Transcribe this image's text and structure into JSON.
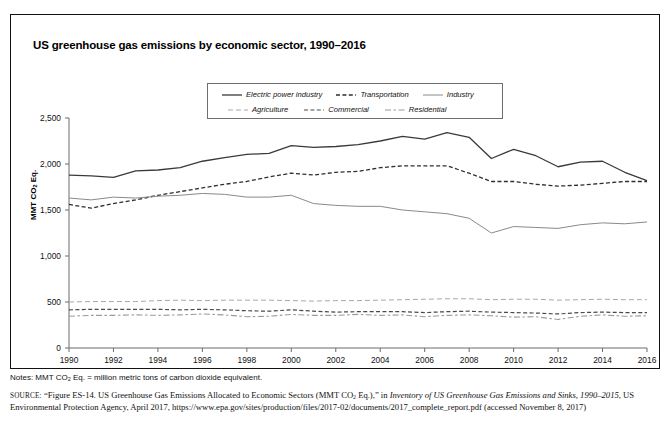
{
  "figure": {
    "title": "US greenhouse gas emissions by economic sector, 1990–2016",
    "notes_prefix": "Notes: MMT CO",
    "notes_sub": "2",
    "notes_suffix": " Eq. = million metric tons of carbon dioxide equivalent.",
    "source_label": "source:",
    "source_part1": "“Figure ES-14. US Greenhouse Gas Emissions Allocated to Economic Sectors (MMT CO",
    "source_sub": "2",
    "source_part2": " Eq.),” in ",
    "source_italic1": "Inventory of US Greenhouse Gas Emissions and Sinks, 1990–2015",
    "source_part3": ", US Environmental Protection Agency, April 2017, https://www.epa.gov/sites/production/files/2017-02/documents/2017_complete_report.pdf (accessed November 8, 2017)"
  },
  "legend": {
    "items": [
      {
        "label": "Electric power industry",
        "style": "solid",
        "color": "#3a3a3a",
        "width": 1.3
      },
      {
        "label": "Transportation",
        "style": "dashed",
        "color": "#2e2e2e",
        "width": 1.3
      },
      {
        "label": "Industry",
        "style": "solid",
        "color": "#8a8a8a",
        "width": 1.0
      },
      {
        "label": "Agriculture",
        "style": "longdash",
        "color": "#a8a8a8",
        "width": 1.0
      },
      {
        "label": "Commercial",
        "style": "dashed",
        "color": "#4a4a4a",
        "width": 1.2
      },
      {
        "label": "Residential",
        "style": "dashdot",
        "color": "#9a9a9a",
        "width": 1.1
      }
    ],
    "row_split": 3
  },
  "chart_data": {
    "type": "line",
    "title": "US greenhouse gas emissions by economic sector, 1990–2016",
    "xlabel": "",
    "ylabel": "MMT CO2 Eq.",
    "ylim": [
      0,
      2500
    ],
    "xlim": [
      1990,
      2016
    ],
    "yticks": [
      0,
      500,
      1000,
      1500,
      2000,
      2500
    ],
    "ytick_labels": [
      "0",
      "500",
      "1,000",
      "1,500",
      "2,000",
      "2,500"
    ],
    "xticks": [
      1990,
      1992,
      1994,
      1996,
      1998,
      2000,
      2002,
      2004,
      2006,
      2008,
      2010,
      2012,
      2014,
      2016
    ],
    "xtick_labels": [
      "1990",
      "1992",
      "1994",
      "1996",
      "1998",
      "2000",
      "2002",
      "2004",
      "2006",
      "2008",
      "2010",
      "2012",
      "2014",
      "2016"
    ],
    "grid": false,
    "legend_position": "top-center",
    "x": [
      1990,
      1991,
      1992,
      1993,
      1994,
      1995,
      1996,
      1997,
      1998,
      1999,
      2000,
      2001,
      2002,
      2003,
      2004,
      2005,
      2006,
      2007,
      2008,
      2009,
      2010,
      2011,
      2012,
      2013,
      2014,
      2015,
      2016
    ],
    "series": [
      {
        "name": "Electric power industry",
        "style": "solid",
        "color": "#3a3a3a",
        "width": 1.3,
        "values": [
          1880,
          1870,
          1855,
          1925,
          1935,
          1960,
          2030,
          2070,
          2105,
          2115,
          2200,
          2180,
          2190,
          2210,
          2250,
          2300,
          2270,
          2340,
          2290,
          2060,
          2160,
          2090,
          1970,
          2020,
          2030,
          1910,
          1820
        ]
      },
      {
        "name": "Transportation",
        "style": "dashed",
        "color": "#2e2e2e",
        "width": 1.3,
        "values": [
          1560,
          1520,
          1570,
          1610,
          1660,
          1700,
          1740,
          1780,
          1810,
          1860,
          1900,
          1880,
          1910,
          1920,
          1960,
          1980,
          1980,
          1980,
          1900,
          1810,
          1810,
          1780,
          1760,
          1770,
          1790,
          1810,
          1810
        ]
      },
      {
        "name": "Industry",
        "style": "solid",
        "color": "#8a8a8a",
        "width": 1.0,
        "values": [
          1630,
          1610,
          1640,
          1630,
          1650,
          1660,
          1680,
          1670,
          1640,
          1640,
          1660,
          1570,
          1550,
          1540,
          1540,
          1500,
          1480,
          1460,
          1410,
          1250,
          1320,
          1310,
          1300,
          1340,
          1360,
          1350,
          1370
        ]
      },
      {
        "name": "Agriculture",
        "style": "longdash",
        "color": "#a8a8a8",
        "width": 1.0,
        "values": [
          500,
          505,
          505,
          505,
          515,
          520,
          515,
          520,
          520,
          520,
          515,
          510,
          515,
          515,
          520,
          525,
          530,
          535,
          535,
          525,
          530,
          530,
          520,
          525,
          530,
          525,
          525
        ]
      },
      {
        "name": "Commercial",
        "style": "dashed",
        "color": "#4a4a4a",
        "width": 1.2,
        "values": [
          415,
          420,
          420,
          420,
          420,
          415,
          420,
          415,
          405,
          400,
          415,
          400,
          390,
          395,
          395,
          395,
          385,
          395,
          400,
          390,
          385,
          380,
          370,
          385,
          390,
          385,
          385
        ]
      },
      {
        "name": "Residential",
        "style": "dashdot",
        "color": "#9a9a9a",
        "width": 1.1,
        "values": [
          345,
          355,
          355,
          360,
          355,
          360,
          370,
          360,
          340,
          345,
          365,
          355,
          355,
          365,
          355,
          360,
          340,
          355,
          360,
          350,
          335,
          340,
          310,
          345,
          360,
          345,
          350
        ]
      }
    ]
  }
}
